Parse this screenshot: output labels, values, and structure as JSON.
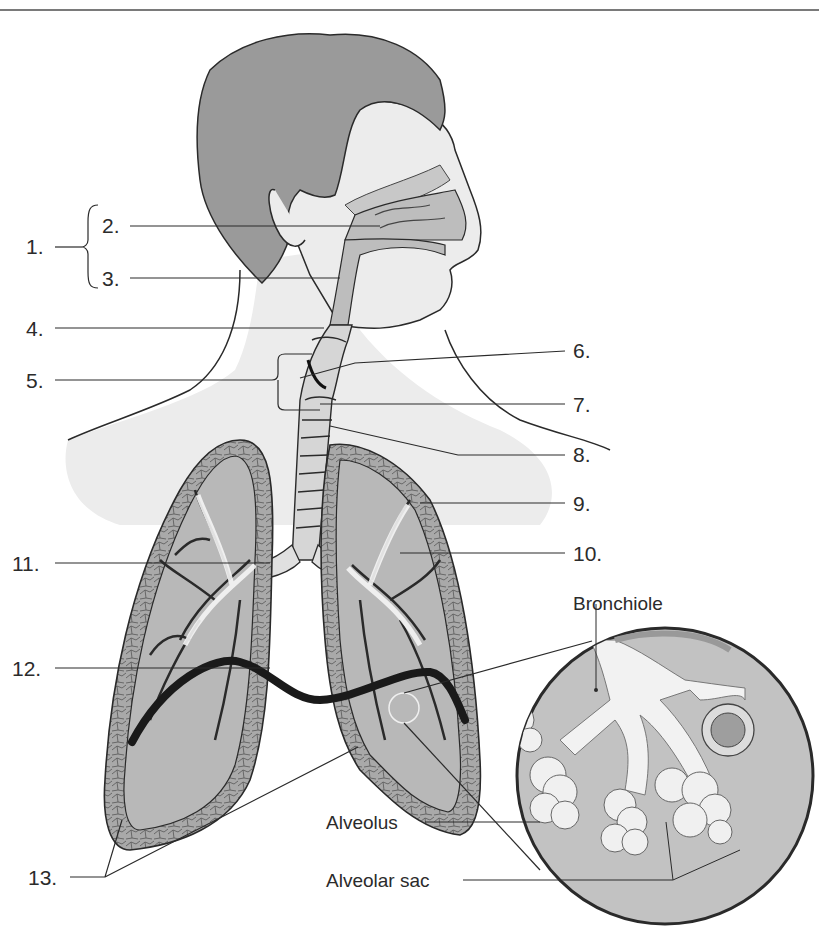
{
  "diagram": {
    "colors": {
      "hair": "#9a9a9a",
      "skin": "#ececec",
      "lung_fill": "#b8b8b8",
      "lung_wall": "#a9a9a9",
      "airway": "#f6f6f6",
      "outline": "#2a2a2a",
      "diaphragm": "#1a1a1a",
      "inset_bg": "#c2c2c2"
    },
    "numbered_labels": [
      {
        "id": "1",
        "text": "1."
      },
      {
        "id": "2",
        "text": "2."
      },
      {
        "id": "3",
        "text": "3."
      },
      {
        "id": "4",
        "text": "4."
      },
      {
        "id": "5",
        "text": "5."
      },
      {
        "id": "6",
        "text": "6."
      },
      {
        "id": "7",
        "text": "7."
      },
      {
        "id": "8",
        "text": "8."
      },
      {
        "id": "9",
        "text": "9."
      },
      {
        "id": "10",
        "text": "10."
      },
      {
        "id": "11",
        "text": "11."
      },
      {
        "id": "12",
        "text": "12."
      },
      {
        "id": "13",
        "text": "13."
      }
    ],
    "inset": {
      "title": "Bronchiole",
      "labels": [
        {
          "text": "Alveolus"
        },
        {
          "text": "Alveolar sac"
        }
      ]
    }
  }
}
